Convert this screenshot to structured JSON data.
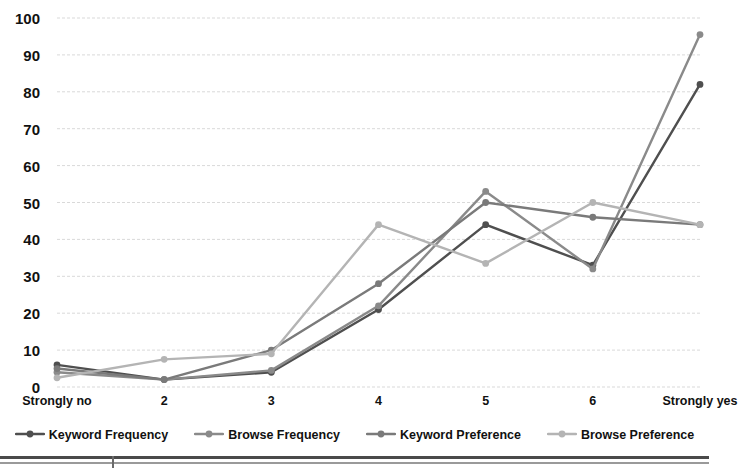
{
  "chart_data": {
    "type": "line",
    "title": "",
    "subtitle": "",
    "xlabel": "",
    "ylabel": "",
    "categories": [
      "Strongly no",
      "2",
      "3",
      "4",
      "5",
      "6",
      "Strongly yes"
    ],
    "ylim": [
      0,
      100
    ],
    "ytick_values": [
      0,
      10,
      20,
      30,
      40,
      50,
      60,
      70,
      80,
      90,
      100
    ],
    "ytick_labels": [
      "0",
      "10",
      "20",
      "30",
      "40",
      "50",
      "60",
      "70",
      "80",
      "90",
      "100"
    ],
    "grid": true,
    "grid_axis": "y",
    "grid_style": "dashed",
    "legend_position": "bottom",
    "series": [
      {
        "name": "Keyword Frequency",
        "color": "#4f4f4f",
        "values": [
          6,
          2,
          4,
          21,
          44,
          33,
          82
        ]
      },
      {
        "name": "Browse Frequency",
        "color": "#8a8a8a",
        "values": [
          4,
          2,
          4.5,
          22,
          53,
          32,
          95.5
        ]
      },
      {
        "name": "Keyword Preference",
        "color": "#7a7a7a",
        "values": [
          5,
          2,
          10,
          28,
          50,
          46,
          44
        ]
      },
      {
        "name": "Browse Preference",
        "color": "#b4b4b4",
        "values": [
          2.5,
          7.5,
          9,
          44,
          33.5,
          50,
          44
        ]
      }
    ]
  },
  "legend": {
    "items": [
      {
        "label": "Keyword Frequency",
        "color": "#4f4f4f"
      },
      {
        "label": "Browse Frequency",
        "color": "#8a8a8a"
      },
      {
        "label": "Keyword Preference",
        "color": "#7a7a7a"
      },
      {
        "label": "Browse Preference",
        "color": "#b4b4b4"
      }
    ]
  },
  "axes": {
    "gridline_color": "#d9d9d9",
    "tick_label_color": "#111111"
  }
}
